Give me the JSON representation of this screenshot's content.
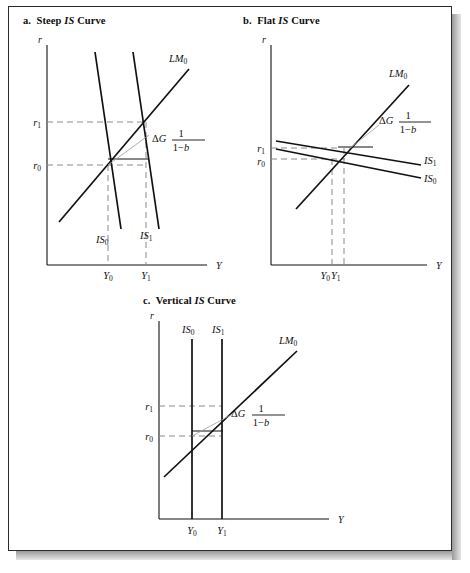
{
  "figure": {
    "panels": [
      {
        "id": "panel-a",
        "title_letter": "a.",
        "title_text_before": "Steep ",
        "title_italic": "IS",
        "title_text_after": " Curve",
        "axes": {
          "y_label": "r",
          "x_label": "Y"
        },
        "rate_ticks": [
          {
            "name": "r1",
            "base": "r",
            "sub": "1"
          },
          {
            "name": "r0",
            "base": "r",
            "sub": "0"
          }
        ],
        "output_ticks": [
          {
            "name": "Y0",
            "base": "Y",
            "sub": "0"
          },
          {
            "name": "Y1",
            "base": "Y",
            "sub": "1"
          }
        ],
        "curves": [
          {
            "name": "IS0",
            "base": "IS",
            "sub": "0",
            "kind": "steep-is"
          },
          {
            "name": "IS1",
            "base": "IS",
            "sub": "1",
            "kind": "steep-is"
          },
          {
            "name": "LM0",
            "base": "LM",
            "sub": "0",
            "kind": "lm"
          }
        ],
        "annotation": {
          "delta": "Δ",
          "variable": "G",
          "numerator": "1",
          "denominator_a": "1",
          "minus": "−",
          "denominator_b": "b"
        }
      },
      {
        "id": "panel-b",
        "title_letter": "b.",
        "title_text_before": "Flat ",
        "title_italic": "IS",
        "title_text_after": " Curve",
        "axes": {
          "y_label": "r",
          "x_label": "Y"
        },
        "rate_ticks": [
          {
            "name": "r1",
            "base": "r",
            "sub": "1"
          },
          {
            "name": "r0",
            "base": "r",
            "sub": "0"
          }
        ],
        "output_ticks": [
          {
            "name": "Y0",
            "base": "Y",
            "sub": "0"
          },
          {
            "name": "Y1",
            "base": "Y",
            "sub": "1"
          }
        ],
        "curves": [
          {
            "name": "IS1",
            "base": "IS",
            "sub": "1",
            "kind": "flat-is"
          },
          {
            "name": "IS0",
            "base": "IS",
            "sub": "0",
            "kind": "flat-is"
          },
          {
            "name": "LM0",
            "base": "LM",
            "sub": "0",
            "kind": "lm"
          }
        ],
        "annotation": {
          "delta": "Δ",
          "variable": "G",
          "numerator": "1",
          "denominator_a": "1",
          "minus": "−",
          "denominator_b": "b"
        }
      },
      {
        "id": "panel-c",
        "title_letter": "c.",
        "title_text_before": "Vertical ",
        "title_italic": "IS",
        "title_text_after": " Curve",
        "axes": {
          "y_label": "r",
          "x_label": "Y"
        },
        "rate_ticks": [
          {
            "name": "r1",
            "base": "r",
            "sub": "1"
          },
          {
            "name": "r0",
            "base": "r",
            "sub": "0"
          }
        ],
        "output_ticks": [
          {
            "name": "Y0",
            "base": "Y",
            "sub": "0"
          },
          {
            "name": "Y1",
            "base": "Y",
            "sub": "1"
          }
        ],
        "curves": [
          {
            "name": "IS0",
            "base": "IS",
            "sub": "0",
            "kind": "vertical-is"
          },
          {
            "name": "IS1",
            "base": "IS",
            "sub": "1",
            "kind": "vertical-is"
          },
          {
            "name": "LM0",
            "base": "LM",
            "sub": "0",
            "kind": "lm"
          }
        ],
        "annotation": {
          "delta": "Δ",
          "variable": "G",
          "numerator": "1",
          "denominator_a": "1",
          "minus": "−",
          "denominator_b": "b"
        }
      }
    ],
    "colors": {
      "ink": "#111111",
      "page": "#ffffff",
      "border": "#2b2b2b",
      "dashed": "#8a8a8a",
      "shadow": "#9a9a9a"
    }
  }
}
